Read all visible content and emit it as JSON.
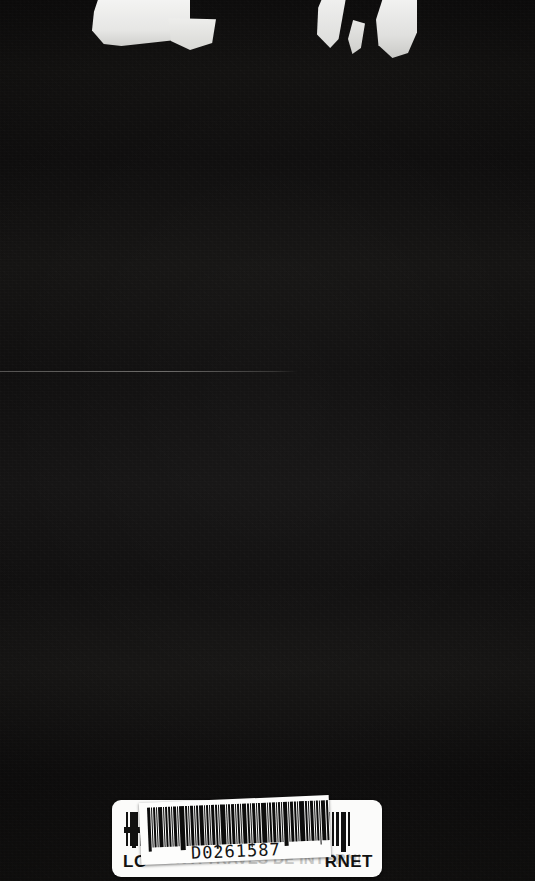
{
  "photo": {
    "subject": "book-back-cover",
    "background_color": "#0d0c0b",
    "accent_color": "#fbfbfa",
    "ink_color": "#111111"
  },
  "top_glyphs": {
    "description": "cut-off white letterforms bleeding off the top edge",
    "count": 5
  },
  "hairline": {
    "description": "faint pale horizontal rule across the upper middle of the cover"
  },
  "isbn_label": {
    "left_text": "LO",
    "right_text": "RNET",
    "ghost_caption": "CION A TRAVES DE INTERNET",
    "left_bar_widths": [
      2,
      4,
      2,
      3,
      6,
      2,
      3,
      2,
      5,
      3
    ],
    "right_bar_widths": [
      4,
      2,
      3,
      5,
      2,
      4,
      2,
      3,
      5,
      2
    ],
    "plus_mark": "crosshair-mark"
  },
  "barcode_sticker": {
    "code": "D0261587",
    "bar_widths": [
      3,
      1,
      2,
      1,
      4,
      1,
      2,
      2,
      1,
      3,
      1,
      5,
      2,
      1,
      3,
      1,
      2,
      4,
      1,
      2,
      1,
      3,
      2,
      1,
      5,
      1,
      2,
      3,
      1,
      2,
      1,
      4,
      2,
      1,
      3,
      1,
      2,
      5,
      1,
      2,
      3,
      1,
      2,
      1,
      4,
      1,
      3,
      2,
      1,
      5,
      2,
      1,
      3,
      1,
      2,
      1,
      4,
      2,
      3,
      1
    ],
    "rotation_degrees": -2.4
  }
}
